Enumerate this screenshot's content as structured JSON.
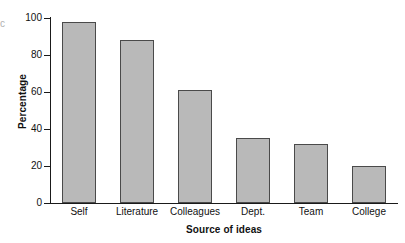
{
  "chart_data": {
    "type": "bar",
    "title": "",
    "subtitle": "",
    "xlabel": "Source of ideas",
    "ylabel": "Percentage",
    "categories": [
      "Self",
      "Literature",
      "Colleagues",
      "Dept.",
      "Team",
      "College"
    ],
    "values": [
      98,
      88,
      61,
      35,
      32,
      20
    ],
    "series": [
      {
        "name": "Percentage",
        "values": [
          98,
          88,
          61,
          35,
          32,
          20
        ]
      }
    ],
    "ylim": [
      0,
      100
    ],
    "y_ticks": [
      0,
      20,
      40,
      60,
      80,
      100
    ],
    "y_tick_labels": [
      "0",
      "20",
      "40",
      "60",
      "80",
      "100"
    ],
    "grid": false,
    "legend": false,
    "legend_position": "none",
    "bar_fill_color": "#b9b9b9",
    "bar_edge_color": "#4a4a4a",
    "axis_color": "#1a1a1a",
    "background_color": "#ffffff",
    "text_color": "#111111",
    "annotations": []
  },
  "artifact": {
    "edge_glyph": "c"
  }
}
